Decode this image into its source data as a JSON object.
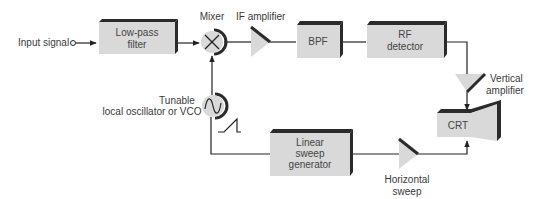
{
  "colors": {
    "block_fill": "#d9d9d9",
    "block_shadow": "#2b2b2b",
    "line": "#222222",
    "label": "#3a3a3a"
  },
  "blocks": {
    "lowpass": {
      "line1": "Low-pass",
      "line2": "filter"
    },
    "bpf": {
      "label": "BPF"
    },
    "rf_detector": {
      "line1": "RF",
      "line2": "detector"
    },
    "sweep_gen": {
      "line1": "Linear",
      "line2": "sweep",
      "line3": "generator"
    },
    "crt": {
      "label": "CRT"
    }
  },
  "labels": {
    "input_signal": "Input signal",
    "mixer": "Mixer",
    "if_amplifier": "IF amplifier",
    "vertical_amp_line1": "Vertical",
    "vertical_amp_line2": "amplifier",
    "oscillator_line1": "Tunable",
    "oscillator_line2": "local oscillator or VCO",
    "horizontal_line1": "Horizontal",
    "horizontal_line2": "sweep"
  },
  "icons": {
    "mixer": "multiply-circle-icon",
    "oscillator": "sine-wave-circle-icon",
    "sawtooth": "sawtooth-wave-icon",
    "amplifier": "triangle-amplifier-icon"
  }
}
